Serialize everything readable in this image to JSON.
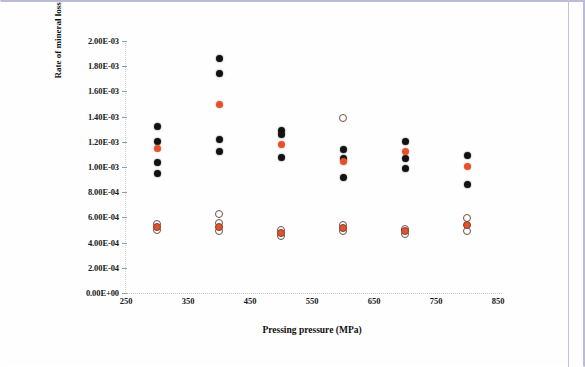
{
  "figure": {
    "name": "rate-of-mineral-loss-scatter",
    "background_color": "#ffffff",
    "frame_color": "#b9bcd4"
  },
  "chart_data": {
    "type": "scatter",
    "title": "",
    "xlabel": "Pressing pressure (MPa)",
    "ylabel": "Rate of mineral loss (g cm-2 h-1)",
    "ylabel_parts": {
      "lead": "Rate of mineral loss (g cm",
      "sup1": "-2",
      "mid": " h",
      "sup2": "-1",
      "tail": ")"
    },
    "xlim": [
      250,
      850
    ],
    "ylim": [
      0.0,
      0.002
    ],
    "xticks": [
      250,
      350,
      450,
      550,
      650,
      750,
      850
    ],
    "xtick_labels": [
      "250",
      "350",
      "450",
      "550",
      "650",
      "750",
      "850"
    ],
    "yticks": [
      0.0,
      0.0002,
      0.0004,
      0.0006,
      0.0008,
      0.001,
      0.0012,
      0.0014,
      0.0016,
      0.0018,
      0.002
    ],
    "ytick_labels": [
      "0.00E+00",
      "2.00E-04",
      "4.00E-04",
      "6.00E-04",
      "8.00E-04",
      "1.00E-03",
      "1.20E-03",
      "1.40E-03",
      "1.60E-03",
      "1.80E-03",
      "2.00E-03"
    ],
    "grid": false,
    "legend": null,
    "marker_styles": {
      "filled": {
        "name": "filled-black-circle",
        "color": "#121212",
        "fill": true
      },
      "orange": {
        "name": "filled-orange-circle",
        "color": "#e8502a",
        "fill": true
      },
      "open": {
        "name": "open-circle",
        "color": "#6e5043",
        "fill": false
      },
      "openorange": {
        "name": "orange-filled-outlined-circle",
        "color": "#e8502a",
        "fill": true
      }
    },
    "series": [
      {
        "name": "Upper group (filled black)",
        "marker": "filled",
        "points": [
          {
            "x": 300,
            "y": 0.001325
          },
          {
            "x": 300,
            "y": 0.001205
          },
          {
            "x": 300,
            "y": 0.001035
          },
          {
            "x": 300,
            "y": 0.000945
          },
          {
            "x": 400,
            "y": 0.001865
          },
          {
            "x": 400,
            "y": 0.001745
          },
          {
            "x": 400,
            "y": 0.001215
          },
          {
            "x": 400,
            "y": 0.001125
          },
          {
            "x": 500,
            "y": 0.00129
          },
          {
            "x": 500,
            "y": 0.00126
          },
          {
            "x": 500,
            "y": 0.001075
          },
          {
            "x": 600,
            "y": 0.00114
          },
          {
            "x": 600,
            "y": 0.00107
          },
          {
            "x": 600,
            "y": 0.000915
          },
          {
            "x": 700,
            "y": 0.001205
          },
          {
            "x": 700,
            "y": 0.00107
          },
          {
            "x": 700,
            "y": 0.00099
          },
          {
            "x": 800,
            "y": 0.00109
          },
          {
            "x": 800,
            "y": 0.000865
          }
        ]
      },
      {
        "name": "Upper group mean (orange)",
        "marker": "orange",
        "points": [
          {
            "x": 300,
            "y": 0.001145
          },
          {
            "x": 400,
            "y": 0.0015
          },
          {
            "x": 500,
            "y": 0.00118
          },
          {
            "x": 600,
            "y": 0.001045
          },
          {
            "x": 700,
            "y": 0.001125
          },
          {
            "x": 800,
            "y": 0.001005
          }
        ]
      },
      {
        "name": "Lower group (open circles)",
        "marker": "open",
        "points": [
          {
            "x": 300,
            "y": 0.000545
          },
          {
            "x": 300,
            "y": 0.0005
          },
          {
            "x": 400,
            "y": 0.000625
          },
          {
            "x": 400,
            "y": 0.000555
          },
          {
            "x": 400,
            "y": 0.000495
          },
          {
            "x": 500,
            "y": 0.0005
          },
          {
            "x": 500,
            "y": 0.00045
          },
          {
            "x": 600,
            "y": 0.001385
          },
          {
            "x": 600,
            "y": 0.00054
          },
          {
            "x": 600,
            "y": 0.00049
          },
          {
            "x": 700,
            "y": 0.00051
          },
          {
            "x": 700,
            "y": 0.000465
          },
          {
            "x": 800,
            "y": 0.000595
          },
          {
            "x": 800,
            "y": 0.00049
          }
        ]
      },
      {
        "name": "Lower group mean (orange outlined)",
        "marker": "openorange",
        "points": [
          {
            "x": 300,
            "y": 0.000522
          },
          {
            "x": 400,
            "y": 0.00052
          },
          {
            "x": 500,
            "y": 0.000478
          },
          {
            "x": 600,
            "y": 0.000515
          },
          {
            "x": 700,
            "y": 0.00049
          },
          {
            "x": 800,
            "y": 0.00054
          }
        ]
      }
    ]
  }
}
